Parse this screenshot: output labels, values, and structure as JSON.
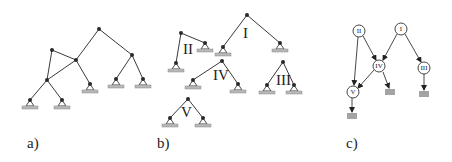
{
  "figure": {
    "panels": [
      {
        "id": "a",
        "label": "a)",
        "description": "Multi-rooted tree / lattice of masses with ground supports",
        "nodes": [
          {
            "id": "top",
            "x": 99,
            "y": 29
          },
          {
            "id": "left-upper",
            "x": 52,
            "y": 50
          },
          {
            "id": "middle",
            "x": 76,
            "y": 60
          },
          {
            "id": "lower-left",
            "x": 47,
            "y": 80
          },
          {
            "id": "right",
            "x": 132,
            "y": 55
          },
          {
            "id": "leaf1",
            "x": 30,
            "y": 100
          },
          {
            "id": "leaf2",
            "x": 62,
            "y": 100
          },
          {
            "id": "leaf3",
            "x": 90,
            "y": 84
          },
          {
            "id": "leaf4",
            "x": 116,
            "y": 79
          },
          {
            "id": "leaf5",
            "x": 143,
            "y": 79
          }
        ]
      },
      {
        "id": "b",
        "label": "b)",
        "description": "Decomposition into substructures",
        "substructures": [
          "I",
          "II",
          "III",
          "IV",
          "V"
        ]
      },
      {
        "id": "c",
        "label": "c)",
        "description": "Directed dependency graph of substructures",
        "nodes": [
          "I",
          "II",
          "III",
          "IV",
          "V"
        ],
        "edges": [
          {
            "from": "II",
            "to": "V"
          },
          {
            "from": "II",
            "to": "IV"
          },
          {
            "from": "I",
            "to": "IV"
          },
          {
            "from": "I",
            "to": "III"
          },
          {
            "from": "IV",
            "to": "V"
          },
          {
            "from": "IV",
            "to": "ground"
          },
          {
            "from": "III",
            "to": "ground"
          },
          {
            "from": "V",
            "to": "ground"
          }
        ]
      }
    ],
    "labels": {
      "a": "a)",
      "b": "b)",
      "c": "c)",
      "I": "I",
      "II": "II",
      "III": "III",
      "IV": "IV",
      "V": "V"
    },
    "colors": {
      "edge": "#3a3a3a",
      "node": "#2a2a2a",
      "support_base": "#b8b8b8"
    }
  }
}
